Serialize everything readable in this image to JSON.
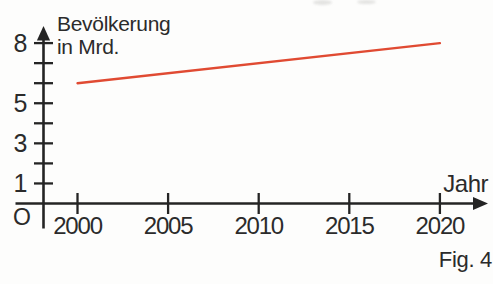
{
  "figure": {
    "caption": "Fig. 4"
  },
  "chart_data": {
    "type": "line",
    "y_axis_label_lines": [
      "Bevölkerung",
      "in Mrd."
    ],
    "x_axis_label": "Jahr",
    "origin_label": "O",
    "axis_color": "#242424",
    "x_ticks": [
      {
        "value": 2000,
        "label": "2000"
      },
      {
        "value": 2005,
        "label": "2005"
      },
      {
        "value": 2010,
        "label": "2010"
      },
      {
        "value": 2015,
        "label": "2015"
      },
      {
        "value": 2020,
        "label": "2020"
      }
    ],
    "y_ticks": [
      {
        "value": 1,
        "label": "1"
      },
      {
        "value": 2,
        "label": ""
      },
      {
        "value": 3,
        "label": "3"
      },
      {
        "value": 4,
        "label": ""
      },
      {
        "value": 5,
        "label": "5"
      },
      {
        "value": 6,
        "label": ""
      },
      {
        "value": 7,
        "label": ""
      },
      {
        "value": 8,
        "label": "8"
      }
    ],
    "xlim": [
      2000,
      2020
    ],
    "ylim": [
      0,
      8.8
    ],
    "grid": false,
    "legend": false,
    "series": [
      {
        "name": "Bevölkerung in Mrd.",
        "color": "#e04a32",
        "points": [
          {
            "x": 2000,
            "y": 6.0
          },
          {
            "x": 2020,
            "y": 8.0
          }
        ]
      }
    ]
  }
}
